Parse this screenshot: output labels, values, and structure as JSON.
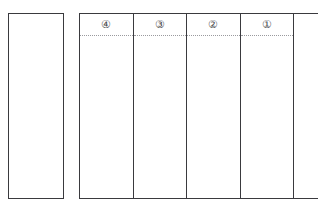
{
  "document": {
    "kind": "japanese-vertical-writing-worksheet",
    "background_color": "#ffffff",
    "border_color": "#3a3a3e",
    "guide_line_color": "#9a9a9e"
  },
  "left_panel": {
    "name": "free-writing-panel",
    "content": ""
  },
  "grid": {
    "columns": [
      {
        "number_label": "④",
        "content": ""
      },
      {
        "number_label": "③",
        "content": ""
      },
      {
        "number_label": "②",
        "content": ""
      },
      {
        "number_label": "①",
        "content": ""
      }
    ],
    "name_column": {
      "label_chars": [
        "名",
        "前"
      ],
      "label_full": "名前",
      "content": ""
    }
  }
}
